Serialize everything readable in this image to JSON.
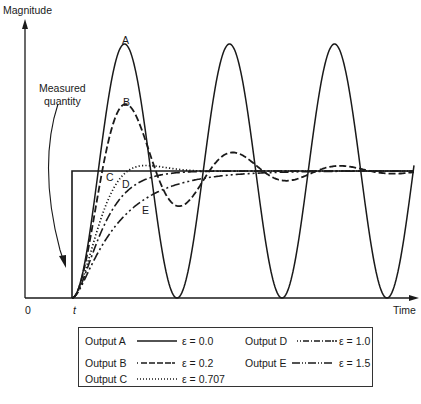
{
  "chart_data": {
    "type": "line",
    "title": "",
    "xlabel": "Time",
    "ylabel": "Magnitude",
    "x_ticks": [
      "0",
      "t"
    ],
    "annotations": [
      "Measured quantity",
      "A",
      "B",
      "C",
      "D",
      "E"
    ],
    "grid": false,
    "legend_position": "bottom (boxed, below plot)",
    "xlim_normalized": [
      0,
      1
    ],
    "ylim_normalized": [
      0,
      2.1
    ],
    "step_input": {
      "name": "Measured quantity",
      "start_time": "t",
      "level": 1.0
    },
    "series": [
      {
        "name": "Output A",
        "label": "A",
        "damping": "ε = 0.0",
        "style": "solid",
        "description": "undamped sinusoid oscillating between 0 and 2x the step level; 3 full peaks visible",
        "peak_value": 2.0,
        "trough_value": 0.0
      },
      {
        "name": "Output B",
        "label": "B",
        "damping": "ε = 0.2",
        "style": "dashed",
        "description": "underdamped oscillation decaying towards step level",
        "peak_value": 1.5,
        "first_undershoot": 0.72
      },
      {
        "name": "Output C",
        "label": "C",
        "damping": "ε = 0.707",
        "style": "dotted",
        "description": "slight overshoot then settles",
        "peak_value": 1.04
      },
      {
        "name": "Output D",
        "label": "D",
        "damping": "ε = 1.0",
        "style": "dash-dot",
        "description": "critically damped, no overshoot"
      },
      {
        "name": "Output E",
        "label": "E",
        "damping": "ε = 1.5",
        "style": "dash-dot-dot",
        "description": "overdamped, slowest rise"
      }
    ]
  },
  "axes": {
    "y_label": "Magnitude",
    "x_label": "Time",
    "origin": "0",
    "t_label": "t"
  },
  "annotation": {
    "measured_line1": "Measured",
    "measured_line2": "quantity"
  },
  "curve_labels": {
    "a": "A",
    "b": "B",
    "c": "C",
    "d": "D",
    "e": "E"
  },
  "legend": {
    "items": [
      {
        "output": "Output A",
        "eps": "ε = 0.0"
      },
      {
        "output": "Output B",
        "eps": "ε = 0.2"
      },
      {
        "output": "Output C",
        "eps": "ε = 0.707"
      },
      {
        "output": "Output D",
        "eps": "ε = 1.0"
      },
      {
        "output": "Output E",
        "eps": "ε = 1.5"
      }
    ]
  }
}
